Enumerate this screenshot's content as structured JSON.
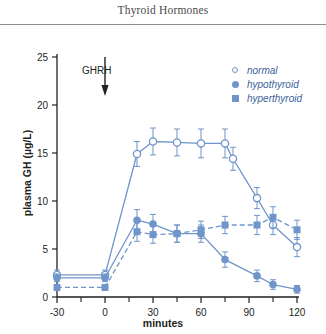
{
  "header": {
    "title": "Thyroid Hormones"
  },
  "legend": {
    "position": "top-right",
    "items": [
      {
        "label": "normal",
        "marker": "open-circle",
        "color": "#6f95ca"
      },
      {
        "label": "hypothyroid",
        "marker": "filled-circle",
        "color": "#6f95ca"
      },
      {
        "label": "hyperthyroid",
        "marker": "filled-square",
        "color": "#6f95ca"
      }
    ]
  },
  "annotation": {
    "label": "GHRH",
    "arrow": "down-arrow-icon",
    "at_x": 0
  },
  "chart_data": {
    "type": "line",
    "title": "Thyroid Hormones",
    "xlabel": "minutes",
    "ylabel": "plasma GH (µg/L)",
    "xlim": [
      -30,
      120
    ],
    "ylim": [
      0,
      25
    ],
    "xticks": [
      -30,
      0,
      30,
      60,
      90,
      120
    ],
    "xticklabels": [
      "-30",
      "0",
      "30",
      "60",
      "90",
      "120"
    ],
    "xminorticks": [
      -15,
      15,
      45,
      75,
      105
    ],
    "yticks": [
      0,
      5,
      10,
      15,
      20,
      25
    ],
    "yticklabels": [
      "0",
      "5",
      "10",
      "15",
      "20",
      "25"
    ],
    "grid": false,
    "accent_color": "#6f95ca",
    "series": [
      {
        "name": "normal",
        "marker": "open-circle",
        "linestyle": "solid",
        "color": "#6f95ca",
        "x": [
          -30,
          0,
          20,
          30,
          45,
          60,
          75,
          80,
          95,
          105,
          120
        ],
        "values": [
          2.3,
          2.3,
          14.9,
          16.2,
          16.1,
          16.0,
          16.0,
          14.4,
          10.3,
          7.5,
          5.2
        ],
        "errors": [
          0.5,
          0.5,
          1.3,
          1.4,
          1.4,
          1.5,
          1.5,
          1.2,
          1.1,
          1.0,
          1.0
        ]
      },
      {
        "name": "hypothyroid",
        "marker": "filled-circle",
        "linestyle": "solid",
        "color": "#6f95ca",
        "x": [
          -30,
          0,
          20,
          30,
          45,
          60,
          75,
          95,
          105,
          120
        ],
        "values": [
          2.0,
          2.0,
          8.0,
          7.6,
          6.6,
          6.6,
          3.9,
          2.2,
          1.3,
          0.8
        ],
        "errors": [
          0.4,
          0.4,
          1.1,
          1.0,
          0.9,
          0.9,
          0.8,
          0.6,
          0.5,
          0.4
        ]
      },
      {
        "name": "hyperthyroid",
        "marker": "filled-square",
        "linestyle": "dashed",
        "color": "#6f95ca",
        "x": [
          -30,
          0,
          20,
          30,
          45,
          60,
          75,
          95,
          105,
          120
        ],
        "values": [
          1.0,
          1.0,
          6.8,
          6.5,
          6.6,
          7.0,
          7.5,
          7.5,
          8.3,
          7.0
        ],
        "errors": [
          0.3,
          0.3,
          1.0,
          0.9,
          0.9,
          0.9,
          0.9,
          1.0,
          1.1,
          1.0
        ]
      }
    ]
  }
}
